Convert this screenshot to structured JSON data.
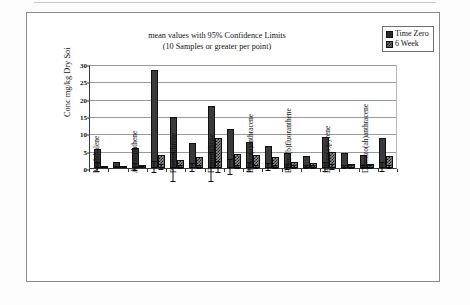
{
  "chart_data": {
    "type": "bar",
    "title": "mean values with 95% Confidence Limits",
    "subtitle": "(10 Samples or greater per point)",
    "xlabel": "",
    "ylabel": "Conc mg/kg Dry Soi",
    "ylim": [
      0,
      30
    ],
    "yticks": [
      0,
      5,
      10,
      15,
      20,
      25,
      30
    ],
    "ytick_labels": [
      "0",
      "5",
      "10",
      "15",
      "20",
      "25",
      "30"
    ],
    "grid": true,
    "legend_position": "top-right",
    "categories": [
      "Naphthalene",
      "",
      "Acenaphthene",
      "",
      "Phenanthrene",
      "",
      "Fluoranthene",
      "",
      "Benzo(a)anthracene",
      "",
      "Benzo(b)fluoranthene",
      "",
      "Benzo(a)pyrene",
      "",
      "Dibenzo(ah)anthracene",
      ""
    ],
    "labeled_categories": [
      "Naphthalene",
      "Acenaphthene",
      "Phenanthrene",
      "Fluoranthene",
      "Benzo(a)anthracene",
      "Benzo(b)fluoranthene",
      "Benzo(a)pyrene",
      "Dibenzo(ah)anthracene"
    ],
    "series": [
      {
        "name": "Time Zero",
        "color": "#2b2b2b",
        "values": [
          5.4,
          1.6,
          5.8,
          28.4,
          14.6,
          7.3,
          17.8,
          11.2,
          7.4,
          6.4,
          4.2,
          3.5,
          9.0,
          4.3,
          3.7,
          8.7
        ],
        "errors_upper": [
          6.9,
          2.0,
          7.1,
          30.2,
          19.0,
          8.6,
          22.2,
          13.4,
          8.8,
          7.5,
          5.0,
          4.2,
          10.4,
          4.8,
          4.4,
          10.2
        ],
        "errors_lower": [
          4.0,
          1.2,
          4.6,
          26.6,
          10.2,
          6.0,
          13.6,
          9.0,
          6.1,
          5.3,
          3.4,
          2.8,
          7.6,
          3.8,
          3.0,
          7.3
        ]
      },
      {
        "name": "6 Week",
        "color": "#6e6e6e",
        "values": [
          0.3,
          0.5,
          0.8,
          3.8,
          2.2,
          3.1,
          8.6,
          3.9,
          3.7,
          3.1,
          1.6,
          1.4,
          4.6,
          1.2,
          1.3,
          3.4
        ],
        "errors_upper": [
          0.5,
          0.8,
          1.1,
          4.6,
          2.7,
          3.7,
          10.3,
          4.5,
          4.4,
          3.7,
          2.2,
          1.9,
          5.4,
          1.7,
          1.8,
          4.0
        ],
        "errors_lower": [
          0.1,
          0.2,
          0.5,
          3.0,
          1.7,
          2.5,
          6.9,
          3.3,
          3.0,
          2.5,
          1.0,
          0.9,
          3.8,
          0.7,
          0.8,
          2.8
        ]
      }
    ]
  },
  "legend": {
    "items": [
      {
        "label": "Time Zero",
        "swatch": "solid-dark-square"
      },
      {
        "label": "6 Week",
        "swatch": "checkered-square"
      }
    ]
  },
  "colors": {
    "time_zero": "#2b2b2b",
    "six_week": "#6e6e6e",
    "gridline": "#9a9a9a",
    "axis": "#3a3a3a",
    "frame": "#8a8a8a",
    "text": "#111111",
    "background": "#ffffff"
  }
}
